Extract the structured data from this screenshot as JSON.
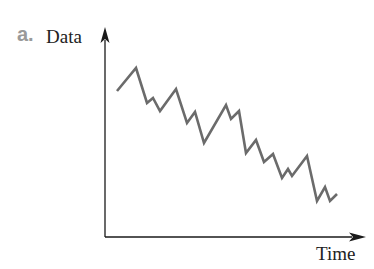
{
  "figure": {
    "panel_label": "a.",
    "y_axis_label": "Data",
    "x_axis_label": "Time",
    "line_color": "#6b6b6b",
    "axis_color": "#1a1a1a"
  },
  "chart_data": {
    "type": "line",
    "title": "",
    "xlabel": "Time",
    "ylabel": "Data",
    "grid": false,
    "ticks": false,
    "trend": "downward with zig-zag fluctuations",
    "series": [
      {
        "name": "Data",
        "points_px": [
          [
            117,
            91
          ],
          [
            136,
            68
          ],
          [
            147,
            103
          ],
          [
            153,
            98
          ],
          [
            160,
            111
          ],
          [
            176,
            89
          ],
          [
            187,
            123
          ],
          [
            195,
            112
          ],
          [
            204,
            143
          ],
          [
            226,
            105
          ],
          [
            231,
            119
          ],
          [
            239,
            111
          ],
          [
            246,
            153
          ],
          [
            256,
            140
          ],
          [
            264,
            162
          ],
          [
            273,
            154
          ],
          [
            282,
            178
          ],
          [
            288,
            169
          ],
          [
            292,
            176
          ],
          [
            307,
            156
          ],
          [
            317,
            201
          ],
          [
            325,
            187
          ],
          [
            330,
            201
          ],
          [
            337,
            194
          ]
        ]
      }
    ]
  }
}
